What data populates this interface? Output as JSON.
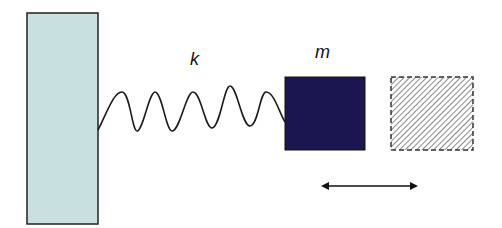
{
  "diagram": {
    "type": "spring-mass system",
    "wall": {
      "fill": "#c9e0e0",
      "stroke": "#222222"
    },
    "spring": {
      "label": "k",
      "stroke": "#1a1a1a"
    },
    "mass": {
      "label": "m",
      "fill": "#1b1650",
      "stroke": "#111111"
    },
    "ghost_mass": {
      "pattern": "diagonal-hatch",
      "stroke": "#333333",
      "style": "dashed"
    },
    "motion_arrow": {
      "direction": "bidirectional-horizontal",
      "stroke": "#111111"
    }
  }
}
